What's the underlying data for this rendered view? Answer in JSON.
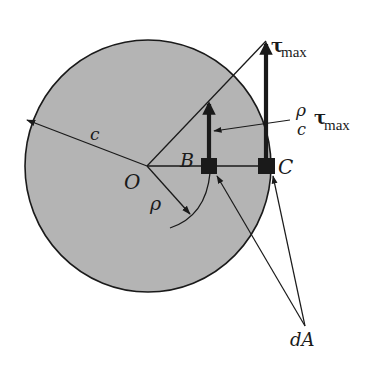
{
  "figure": {
    "type": "torsion-shear-stress-distribution",
    "colors": {
      "cross_section_fill": "#b4b4b4",
      "ink": "#1a1a1a",
      "background": "#ffffff"
    }
  },
  "labels": {
    "center": "O",
    "radius": "c",
    "radial_distance": "ρ",
    "point_b": "B",
    "point_c": "C",
    "area_element": "dA",
    "tau_max_symbol": "τ",
    "tau_max_subscript": "max",
    "fraction_numerator": "ρ",
    "fraction_denominator": "c",
    "fraction_tau_symbol": "τ",
    "fraction_tau_subscript": "max"
  }
}
